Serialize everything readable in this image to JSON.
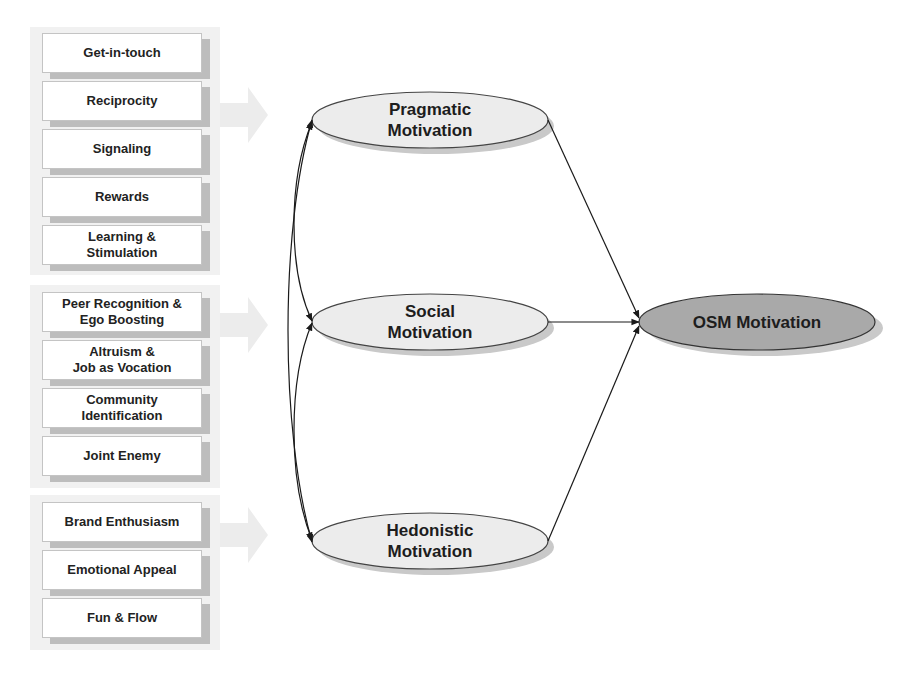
{
  "groups": [
    {
      "name": "pragmatic-factors",
      "items": [
        "Get-in-touch",
        "Reciprocity",
        "Signaling",
        "Rewards",
        "Learning &\nStimulation"
      ]
    },
    {
      "name": "social-factors",
      "items": [
        "Peer Recognition &\nEgo Boosting",
        "Altruism &\nJob as Vocation",
        "Community\nIdentification",
        "Joint Enemy"
      ]
    },
    {
      "name": "hedonistic-factors",
      "items": [
        "Brand Enthusiasm",
        "Emotional Appeal",
        "Fun & Flow"
      ]
    }
  ],
  "constructs": {
    "pragmatic": "Pragmatic\nMotivation",
    "social": "Social\nMotivation",
    "hedonistic": "Hedonistic\nMotivation",
    "osm": "OSM Motivation"
  },
  "colors": {
    "construct_fill": "#ececec",
    "osm_fill": "#a9a9a9",
    "line": "#1a1a1a",
    "shadow": "#bdbdbd"
  }
}
